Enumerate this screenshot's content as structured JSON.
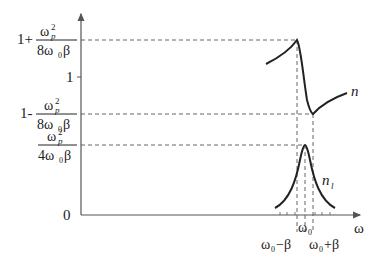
{
  "diagram": {
    "type": "dispersion-absorption-curves",
    "axes": {
      "x_label": "ω",
      "y_ticks": [
        {
          "id": "upper",
          "prefix": "1+",
          "numerator": "ω",
          "num_sup": "2",
          "num_sub": "p",
          "denominator": "8ω",
          "den_sub": "0",
          "den_tail": "β"
        },
        {
          "id": "one",
          "label": "1"
        },
        {
          "id": "lower",
          "prefix": "1-",
          "numerator": "ω",
          "num_sup": "2",
          "num_sub": "p",
          "denominator": "8ω",
          "den_sub": "0",
          "den_tail": "β"
        },
        {
          "id": "peak",
          "prefix": "",
          "numerator": "ω",
          "num_sup": "2",
          "num_sub": "p",
          "denominator": "4ω",
          "den_sub": "0",
          "den_tail": "β"
        },
        {
          "id": "zero",
          "label": "0"
        }
      ],
      "x_ticks": {
        "left": {
          "base": "ω",
          "sub": "0",
          "tail": "−β"
        },
        "center": {
          "base": "ω",
          "sub": "0"
        },
        "right": {
          "base": "ω",
          "sub": "0",
          "tail": "+β"
        }
      }
    },
    "curves": {
      "refractive_index": {
        "label": "n"
      },
      "absorption": {
        "label": "n",
        "label_sub": "l"
      }
    },
    "colors": {
      "line": "#222222",
      "axis": "#555555",
      "dashed": "#555555"
    }
  }
}
